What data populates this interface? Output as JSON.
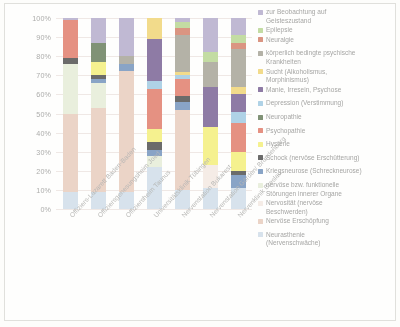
{
  "chart_data": {
    "type": "bar",
    "title": "",
    "subtitle": "",
    "xlabel": "",
    "ylabel": "",
    "stacked": true,
    "normalized": "100%",
    "grid": true,
    "legend_position": "right",
    "ylim": [
      0,
      100
    ],
    "yticks": [
      "0%",
      "10%",
      "20%",
      "30%",
      "40%",
      "50%",
      "60%",
      "70%",
      "80%",
      "90%",
      "100%"
    ],
    "categories": [
      "Offiziers-Lazarett Baden-Baden",
      "Offiziersgenesungsheim Joed",
      "Offiziersheim Taunus",
      "Universitätsklinik Tübingen",
      "Nervenstation Bukarest",
      "Nervenstation Görden/ Brandenburg",
      "Nervenklinik Breslau"
    ],
    "series": [
      {
        "name": "Neurasthenie (Nervenschwäche)",
        "color": "#bcd3e8",
        "values": [
          9,
          9,
          9,
          22,
          10,
          11,
          11
        ]
      },
      {
        "name": "Nervöse Erschöpfung",
        "color": "#e8b9a2",
        "values": [
          41,
          44,
          63,
          0,
          42,
          0,
          0
        ]
      },
      {
        "name": "Nervosität (nervöse Beschwerden)",
        "color": "#f3e3d8",
        "values": [
          0,
          0,
          0,
          0,
          0,
          12,
          0
        ]
      },
      {
        "name": "nervöse bzw. funktionelle Störungen innerer Organe",
        "color": "#dde9c6",
        "values": [
          26,
          13,
          0,
          6,
          0,
          0,
          0
        ]
      },
      {
        "name": "Kriegsneurose (Schreckneurose)",
        "color": "#3b6fb5",
        "values": [
          0,
          2,
          4,
          3,
          4,
          0,
          7
        ]
      },
      {
        "name": "Schock (nervöse Erschütterung)",
        "color": "#121212",
        "values": [
          3,
          2,
          0,
          4,
          3,
          0,
          2
        ]
      },
      {
        "name": "Hysterie",
        "color": "#f5ed2e",
        "values": [
          0,
          7,
          0,
          7,
          0,
          20,
          10
        ]
      },
      {
        "name": "Psychopathie",
        "color": "#ef4a2e",
        "values": [
          20,
          0,
          0,
          21,
          9,
          0,
          15
        ]
      },
      {
        "name": "Neuropathie",
        "color": "#31541e",
        "values": [
          0,
          10,
          0,
          0,
          0,
          0,
          0
        ]
      },
      {
        "name": "Depression (Verstimmung)",
        "color": "#77bbe3",
        "values": [
          0,
          0,
          0,
          4,
          2,
          0,
          6
        ]
      },
      {
        "name": "Manie, Irresein, Psychose",
        "color": "#4f2a7d",
        "values": [
          0,
          0,
          0,
          22,
          0,
          21,
          9
        ]
      },
      {
        "name": "Sucht (Alkoholismus, Morphinismus)",
        "color": "#f4c72b",
        "values": [
          0,
          0,
          0,
          11,
          2,
          0,
          4
        ]
      },
      {
        "name": "körperlich bedingte psychische Krankheiten",
        "color": "#8a8572",
        "values": [
          0,
          0,
          4,
          0,
          19,
          13,
          20
        ]
      },
      {
        "name": "Neuralgie",
        "color": "#d9522e",
        "values": [
          0,
          0,
          0,
          0,
          4,
          0,
          3
        ]
      },
      {
        "name": "Epilepsie",
        "color": "#9ccb5e",
        "values": [
          0,
          0,
          0,
          0,
          3,
          5,
          4
        ]
      },
      {
        "name": "zur Beobachtung auf Geisteszustand",
        "color": "#9d8fc4",
        "values": [
          1,
          13,
          20,
          0,
          2,
          18,
          9
        ]
      }
    ]
  },
  "legend": {
    "entries": [
      {
        "label_lines": [
          "zur Beobachtung auf",
          "Geisteszustand"
        ],
        "color": "#9d8fc4"
      },
      {
        "label_lines": [
          "Epilepsie"
        ],
        "color": "#9ccb5e"
      },
      {
        "label_lines": [
          "Neuralgie"
        ],
        "color": "#d9522e"
      },
      {
        "label_lines": [
          "körperlich bedingte psychische",
          "Krankheiten"
        ],
        "color": "#8a8572"
      },
      {
        "label_lines": [
          "Sucht (Alkoholismus,",
          "Morphinismus)"
        ],
        "color": "#f4c72b"
      },
      {
        "label_lines": [
          "Manie, Irresein, Psychose"
        ],
        "color": "#4f2a7d"
      },
      {
        "label_lines": [
          "Depression (Verstimmung)"
        ],
        "color": "#77bbe3"
      },
      {
        "label_lines": [
          "Neuropathie"
        ],
        "color": "#31541e"
      },
      {
        "label_lines": [
          "Psychopathie"
        ],
        "color": "#ef4a2e"
      },
      {
        "label_lines": [
          "Hysterie"
        ],
        "color": "#f5ed2e"
      },
      {
        "label_lines": [
          "Schock (nervöse Erschütterung)"
        ],
        "color": "#121212"
      },
      {
        "label_lines": [
          "Kriegsneurose (Schreckneurose)"
        ],
        "color": "#3b6fb5"
      },
      {
        "label_lines": [
          "nervöse bzw. funktionelle",
          "Störungen innerer Organe"
        ],
        "color": "#dde9c6"
      },
      {
        "label_lines": [
          "Nervosität (nervöse",
          "Beschwerden)"
        ],
        "color": "#f3e3d8"
      },
      {
        "label_lines": [
          "Nervöse Erschöpfung"
        ],
        "color": "#e8b9a2"
      },
      {
        "label_lines": [
          "Neurasthenie",
          "(Nervenschwäche)"
        ],
        "color": "#bcd3e8"
      }
    ]
  }
}
